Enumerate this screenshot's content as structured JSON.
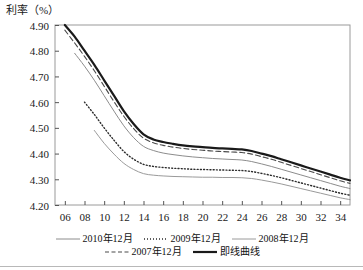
{
  "axis": {
    "y_title": "利率（%）",
    "y_ticks": [
      "4.90",
      "4.80",
      "4.70",
      "4.60",
      "4.50",
      "4.40",
      "4.30",
      "4.20"
    ],
    "x_ticks": [
      "06",
      "08",
      "10",
      "12",
      "14",
      "16",
      "18",
      "20",
      "22",
      "24",
      "26",
      "28",
      "30",
      "32",
      "34"
    ]
  },
  "legend": {
    "rows": [
      [
        {
          "label": "2010年12月",
          "style": "solid-thin",
          "color": "#8c8c8c"
        },
        {
          "label": "2009年12月",
          "style": "dotted",
          "color": "#2b2b2b"
        },
        {
          "label": "2008年12月",
          "style": "solid-medium",
          "color": "#9a9a9a"
        }
      ],
      [
        {
          "label": "2007年12月",
          "style": "dashed",
          "color": "#4a4a4a"
        },
        {
          "label": "即线曲线",
          "style": "solid-thick",
          "color": "#1a1a1a"
        }
      ]
    ]
  },
  "chart_data": {
    "type": "line",
    "title": "",
    "xlabel": "",
    "ylabel": "利率（%）",
    "xlim": [
      5,
      35
    ],
    "ylim": [
      4.2,
      4.9
    ],
    "grid": false,
    "legend_position": "bottom",
    "x": [
      6,
      7,
      8,
      9,
      10,
      11,
      12,
      13,
      14,
      15,
      16,
      17,
      18,
      19,
      20,
      21,
      22,
      23,
      24,
      25,
      26,
      27,
      28,
      29,
      30,
      31,
      32,
      33,
      34,
      35
    ],
    "series": [
      {
        "name": "即线曲线",
        "style": "solid-thick",
        "color": "#1a1a1a",
        "x_start": 6,
        "values": [
          4.9,
          4.855,
          4.8,
          4.745,
          4.685,
          4.625,
          4.565,
          4.515,
          4.475,
          4.455,
          4.445,
          4.438,
          4.432,
          4.428,
          4.425,
          4.422,
          4.42,
          4.418,
          4.416,
          4.41,
          4.4,
          4.39,
          4.378,
          4.366,
          4.354,
          4.342,
          4.33,
          4.318,
          4.306,
          4.296
        ]
      },
      {
        "name": "2007年12月",
        "style": "dashed",
        "color": "#4a4a4a",
        "x_start": 6,
        "values": [
          4.88,
          4.83,
          4.778,
          4.722,
          4.662,
          4.602,
          4.545,
          4.497,
          4.46,
          4.442,
          4.432,
          4.425,
          4.42,
          4.416,
          4.413,
          4.41,
          4.408,
          4.406,
          4.404,
          4.398,
          4.388,
          4.378,
          4.366,
          4.354,
          4.342,
          4.33,
          4.318,
          4.306,
          4.294,
          4.284
        ]
      },
      {
        "name": "2010年12月",
        "style": "solid-thin",
        "color": "#8c8c8c",
        "x_start": 7,
        "values": [
          null,
          4.79,
          4.74,
          4.685,
          4.625,
          4.565,
          4.508,
          4.462,
          4.428,
          4.412,
          4.402,
          4.396,
          4.391,
          4.387,
          4.384,
          4.381,
          4.379,
          4.377,
          4.375,
          4.369,
          4.36,
          4.35,
          4.339,
          4.328,
          4.317,
          4.306,
          4.295,
          4.284,
          4.273,
          4.264
        ]
      },
      {
        "name": "2009年12月",
        "style": "dotted",
        "color": "#2b2b2b",
        "x_start": 8,
        "values": [
          null,
          null,
          4.6,
          4.552,
          4.5,
          4.452,
          4.408,
          4.378,
          4.358,
          4.35,
          4.346,
          4.343,
          4.341,
          4.339,
          4.338,
          4.337,
          4.336,
          4.335,
          4.334,
          4.33,
          4.323,
          4.315,
          4.306,
          4.296,
          4.286,
          4.276,
          4.266,
          4.256,
          4.246,
          4.238
        ]
      },
      {
        "name": "2008年12月",
        "style": "solid-medium",
        "color": "#9a9a9a",
        "x_start": 9,
        "values": [
          null,
          null,
          null,
          4.49,
          4.44,
          4.398,
          4.362,
          4.338,
          4.322,
          4.316,
          4.313,
          4.311,
          4.31,
          4.309,
          4.308,
          4.308,
          4.307,
          4.307,
          4.306,
          4.303,
          4.297,
          4.29,
          4.282,
          4.273,
          4.264,
          4.255,
          4.246,
          4.237,
          4.228,
          4.221
        ]
      }
    ]
  }
}
